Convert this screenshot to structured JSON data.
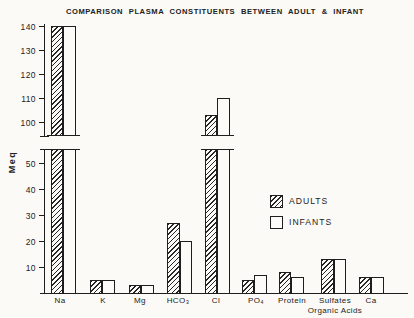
{
  "title": "COMPARISON PLASMA CONSTITUENTS BETWEEN ADULT & INFANT",
  "colors": {
    "ink": "#1e1e1e",
    "paper": "#fbfaf6"
  },
  "chart_data": {
    "type": "bar",
    "title": "COMPARISON PLASMA CONSTITUENTS BETWEEN ADULT & INFANT",
    "xlabel": "",
    "ylabel": "Meq",
    "unit": "Meq",
    "broken_axis": true,
    "lower_ylim": [
      0,
      55
    ],
    "upper_ylim": [
      95,
      140
    ],
    "lower_ticks": [
      10,
      20,
      30,
      40,
      50
    ],
    "upper_ticks": [
      100,
      110,
      120,
      130,
      140
    ],
    "grid": false,
    "legend_position": "center-right",
    "categories": [
      "Na",
      "K",
      "Mg",
      "HCO₃",
      "Cl",
      "PO₄",
      "Protein",
      "Sulfates\nOrganic Acids",
      "Ca"
    ],
    "series": [
      {
        "name": "ADULTS",
        "style": "hatched",
        "values": [
          140,
          5,
          3,
          27,
          103,
          5,
          8,
          13,
          6
        ]
      },
      {
        "name": "INFANTS",
        "style": "open",
        "values": [
          140,
          5,
          3,
          20,
          110,
          7,
          6,
          13,
          6
        ]
      }
    ]
  }
}
